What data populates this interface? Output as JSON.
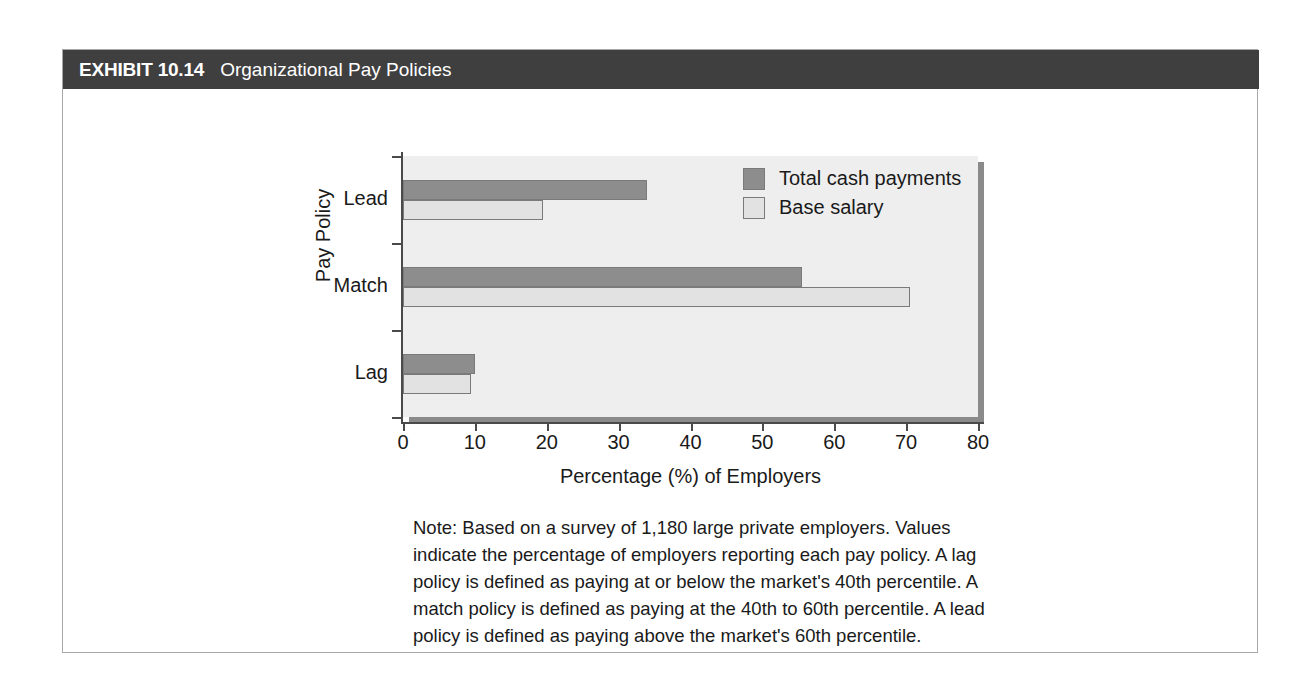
{
  "exhibit": {
    "number": "EXHIBIT 10.14",
    "title": "Organizational Pay Policies",
    "header_bg": "#3f3f3f",
    "header_fg": "#ffffff"
  },
  "note": {
    "text": "Note: Based on a survey of 1,180 large private employers. Values indicate the percentage of employers reporting each pay policy. A lag policy is defined as paying at or below the market's 40th percentile. A match policy is defined as paying at the 40th to 60th percentile. A lead policy is defined as paying above the market's 60th percentile."
  },
  "chart_data": {
    "type": "bar",
    "orientation": "horizontal",
    "title": "",
    "xlabel": "Percentage (%) of Employers",
    "ylabel": "Pay Policy",
    "categories": [
      "Lead",
      "Match",
      "Lag"
    ],
    "series": [
      {
        "name": "Total cash payments",
        "color": "#8d8d8d",
        "values": [
          34,
          55.5,
          10
        ]
      },
      {
        "name": "Base salary",
        "color": "#e2e2e2",
        "values": [
          19.5,
          70.5,
          9.5
        ]
      }
    ],
    "xlim": [
      0,
      80
    ],
    "xticks": [
      0,
      10,
      20,
      30,
      40,
      50,
      60,
      70,
      80
    ],
    "xtick_labels": [
      "0",
      "10",
      "20",
      "30",
      "40",
      "50",
      "60",
      "70",
      "80"
    ],
    "grid": false,
    "legend_position": "top-right",
    "plot_bg": "#eeeeee",
    "axis_color": "#4a4a4a"
  }
}
